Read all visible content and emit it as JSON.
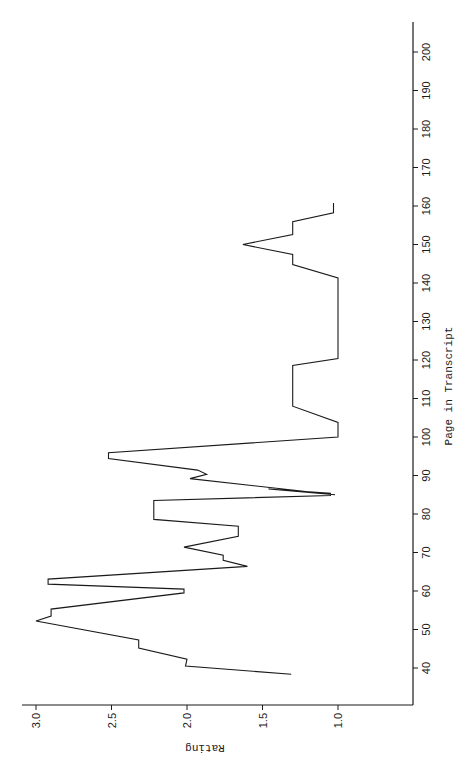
{
  "chart_data": {
    "type": "line",
    "orientation": "rotated-90-ccw",
    "title": "",
    "xlabel": "Page in Transcript",
    "ylabel": "Rating",
    "xlim": [
      32,
      206
    ],
    "ylim": [
      0.7,
      3.05
    ],
    "x_ticks": [
      40,
      50,
      60,
      70,
      80,
      90,
      100,
      110,
      120,
      130,
      140,
      150,
      160,
      170,
      180,
      190,
      200
    ],
    "y_ticks": [
      "3.0",
      "2.5",
      "2.0",
      "1.5",
      "1.0"
    ],
    "y_tick_values": [
      3.0,
      2.5,
      2.0,
      1.5,
      1.0
    ],
    "grid": false,
    "legend": null,
    "series": [
      {
        "name": "Rating",
        "color": "#1a1a1a",
        "points": [
          [
            38.4,
            1.31
          ],
          [
            40.5,
            2.01
          ],
          [
            42.3,
            2.0
          ],
          [
            42.3,
            2.0
          ],
          [
            45.2,
            2.32
          ],
          [
            47.3,
            2.32
          ],
          [
            52.2,
            3.0
          ],
          [
            53.5,
            2.9
          ],
          [
            55.3,
            2.9
          ],
          [
            59.5,
            2.02
          ],
          [
            60.5,
            2.02
          ],
          [
            61.8,
            2.92
          ],
          [
            63.1,
            2.92
          ],
          [
            66.4,
            1.6
          ],
          [
            68.0,
            1.76
          ],
          [
            69.3,
            1.76
          ],
          [
            71.4,
            2.02
          ],
          [
            74.2,
            1.66
          ],
          [
            76.8,
            1.66
          ],
          [
            78.6,
            2.22
          ],
          [
            83.5,
            2.22
          ],
          [
            84.8,
            1.05
          ],
          [
            85.4,
            1.05
          ],
          [
            86.5,
            1.46
          ],
          [
            85.0,
            1.02
          ],
          [
            89.2,
            1.98
          ],
          [
            90.3,
            1.87
          ],
          [
            91.4,
            1.93
          ],
          [
            94.4,
            2.52
          ],
          [
            95.9,
            2.52
          ],
          [
            100.0,
            1.0
          ],
          [
            103.8,
            1.0
          ],
          [
            108.0,
            1.3
          ],
          [
            118.6,
            1.3
          ],
          [
            120.4,
            1.0
          ],
          [
            141.3,
            1.0
          ],
          [
            144.8,
            1.3
          ],
          [
            147.4,
            1.3
          ],
          [
            150.0,
            1.63
          ],
          [
            152.6,
            1.3
          ],
          [
            155.9,
            1.3
          ],
          [
            158.2,
            1.03
          ],
          [
            160.8,
            1.03
          ]
        ]
      }
    ]
  },
  "axes": {
    "page_axis_title": "Page in Transcript",
    "rating_axis_title": "Rating",
    "page_ticks": [
      "40",
      "50",
      "60",
      "70",
      "80",
      "90",
      "100",
      "110",
      "120",
      "130",
      "140",
      "150",
      "160",
      "170",
      "180",
      "190",
      "200"
    ],
    "rating_ticks": [
      "3.0",
      "2.5",
      "2.0",
      "1.5",
      "1.0"
    ]
  },
  "colors": {
    "ink": "#1a1a1a",
    "background": "#ffffff"
  }
}
